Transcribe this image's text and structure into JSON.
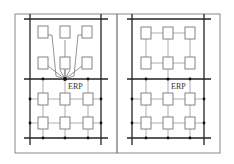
{
  "figure": {
    "panels": [
      {
        "id": "left",
        "label": "ERP",
        "description": "Upper modules wired radially to a single ERP connection point on the middle bus; lower modules in a grid on bus lines"
      },
      {
        "id": "right",
        "label": "ERP",
        "description": "Upper modules connected in a grid; lower modules in a grid on bus lines"
      }
    ],
    "colors": {
      "frame": "#888888",
      "bus": "#222222",
      "wire": "#777777",
      "box_stroke": "#777777",
      "node": "#111111"
    }
  }
}
